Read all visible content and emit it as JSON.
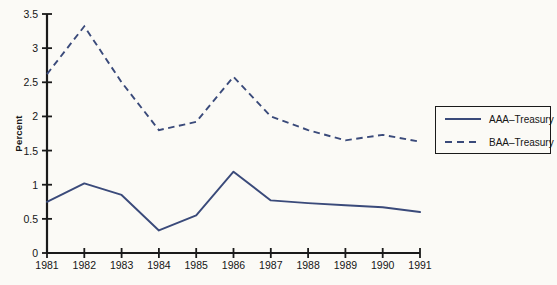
{
  "chart_data": {
    "type": "line",
    "title": "",
    "xlabel": "",
    "ylabel": "Percent",
    "categories": [
      "1981",
      "1982",
      "1983",
      "1984",
      "1985",
      "1986",
      "1987",
      "1988",
      "1989",
      "1990",
      "1991"
    ],
    "x": [
      1981,
      1982,
      1983,
      1984,
      1985,
      1986,
      1987,
      1988,
      1989,
      1990,
      1991
    ],
    "xlim": [
      1981,
      1991
    ],
    "ylim": [
      0,
      3.5
    ],
    "yticks": [
      0,
      0.5,
      1,
      1.5,
      2,
      2.5,
      3,
      3.5
    ],
    "ytick_labels": [
      "0",
      "0.5",
      "1",
      "1.5",
      "2",
      "2.5",
      "3",
      "3.5"
    ],
    "grid": false,
    "legend_position": "right",
    "series": [
      {
        "name": "AAA–Treasury",
        "style": "solid",
        "color": "#3a4a7a",
        "values": [
          0.75,
          1.02,
          0.85,
          0.33,
          0.55,
          1.19,
          0.77,
          0.73,
          0.7,
          0.67,
          0.6
        ]
      },
      {
        "name": "BAA–Treasury",
        "style": "dashed",
        "color": "#3a4a7a",
        "values": [
          2.62,
          3.32,
          2.5,
          1.8,
          1.92,
          2.58,
          2.0,
          1.8,
          1.65,
          1.73,
          1.63
        ]
      }
    ]
  },
  "legend": {
    "items": [
      {
        "label": "AAA–Treasury",
        "style": "solid"
      },
      {
        "label": "BAA–Treasury",
        "style": "dashed"
      }
    ]
  },
  "colors": {
    "line": "#3a4a7a",
    "axis": "#1a1a1a",
    "background": "#fbfaf6",
    "text": "#151515"
  }
}
